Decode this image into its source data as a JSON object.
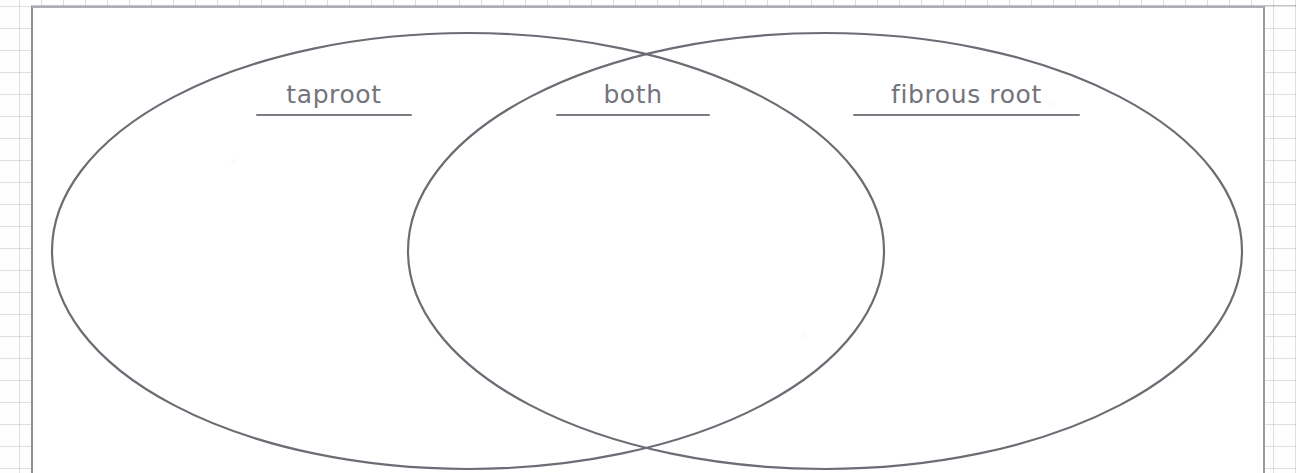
{
  "document": {
    "type": "venn-diagram-worksheet",
    "title": "Root Types Venn Diagram"
  },
  "colors": {
    "ellipse_stroke": "#6c6c74",
    "label_text": "#74747c",
    "label_rule": "#7c7c84",
    "page_background": "#ffffff",
    "grid_line": "#96969f",
    "page_border": "#8e8e97"
  },
  "chart_data": {
    "type": "diagram",
    "subtype": "venn",
    "set_count": 2,
    "sets": [
      {
        "id": "left",
        "label": "taproot",
        "center_x": 468,
        "center_y": 251,
        "radius_x": 416,
        "radius_y": 218,
        "items": []
      },
      {
        "id": "right",
        "label": "fibrous root",
        "center_x": 825,
        "center_y": 251,
        "radius_x": 417,
        "radius_y": 218,
        "items": []
      }
    ],
    "intersection": {
      "id": "both",
      "label": "both",
      "items": []
    },
    "intersection_points": [
      {
        "x": 645,
        "y": 57
      },
      {
        "x": 645,
        "y": 448
      }
    ]
  },
  "labels": {
    "left": "taproot",
    "center": "both",
    "right": "fibrous root"
  }
}
